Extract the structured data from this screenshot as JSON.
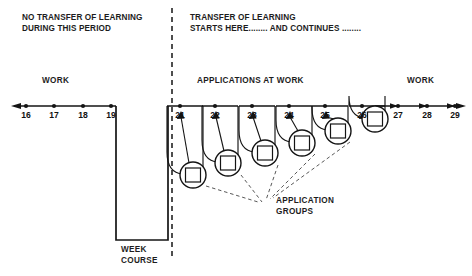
{
  "figure": {
    "title_left_line1": "NO TRANSFER OF LEARNING",
    "title_left_line2": "DURING THIS PERIOD",
    "title_right_line1": "TRANSFER OF LEARNING",
    "title_right_line2": "STARTS HERE........ AND CONTINUES  ........",
    "label_work_left": "WORK",
    "label_applications": "APPLICATIONS AT WORK",
    "label_work_right": "WORK",
    "label_week_course_line1": "WEEK",
    "label_week_course_line2": "COURSE",
    "label_application_groups_line1": "APPLICATION",
    "label_application_groups_line2": "GROUPS"
  },
  "chart_data": {
    "type": "diagram",
    "xlabel": "Week number",
    "axis": {
      "y_baseline": 106,
      "x_start": 12,
      "x_end": 466,
      "left_arrow": true,
      "right_arrow": true
    },
    "weeks": [
      {
        "label": "16",
        "x": 26,
        "tick": true,
        "group": false
      },
      {
        "label": "17",
        "x": 54,
        "tick": true,
        "group": false
      },
      {
        "label": "18",
        "x": 83,
        "tick": true,
        "group": false
      },
      {
        "label": "19",
        "x": 111,
        "tick": true,
        "group": false
      },
      {
        "label": "21",
        "x": 180,
        "tick": true,
        "group": true,
        "circle_x": 193,
        "circle_y": 175,
        "circle_r": 13
      },
      {
        "label": "22",
        "x": 215,
        "tick": true,
        "group": true,
        "circle_x": 228,
        "circle_y": 163,
        "circle_r": 13
      },
      {
        "label": "23",
        "x": 252,
        "tick": true,
        "group": true,
        "circle_x": 265,
        "circle_y": 153,
        "circle_r": 13
      },
      {
        "label": "24",
        "x": 289,
        "tick": true,
        "group": true,
        "circle_x": 302,
        "circle_y": 143,
        "circle_r": 13
      },
      {
        "label": "25",
        "x": 325,
        "tick": true,
        "group": true,
        "circle_x": 338,
        "circle_y": 131,
        "circle_r": 13
      },
      {
        "label": "26",
        "x": 362,
        "tick": true,
        "group": true,
        "circle_x": 375,
        "circle_y": 119,
        "circle_r": 13
      },
      {
        "label": "27",
        "x": 398,
        "tick": true,
        "group": false
      },
      {
        "label": "28",
        "x": 427,
        "tick": true,
        "group": false
      },
      {
        "label": "29",
        "x": 455,
        "tick": true,
        "group": false
      }
    ],
    "week_course_box": {
      "x": 116,
      "y": 106,
      "width": 52,
      "height": 134
    },
    "divider_x": 172,
    "divider_y_top": 8,
    "divider_y_bottom": 256,
    "application_group_count": 6
  }
}
